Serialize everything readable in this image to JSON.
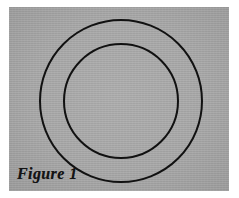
{
  "figure": {
    "caption": "Figure 1",
    "alt_description": "Two concentric circles drawn in black on a gray rectangular plate",
    "plate": {
      "fill_color": "#a8a8a8",
      "x": 9,
      "y": 7,
      "width": 220,
      "height": 184
    },
    "page_background_color": "#ffffff",
    "stroke_color": "#111111",
    "stroke_width": 2
  },
  "chart_data": {
    "type": "diagram",
    "title": "Figure 1",
    "subtitle": "",
    "xlabel": "",
    "ylabel": "",
    "grid": false,
    "legend": "none",
    "shapes": [
      {
        "name": "outer-circle",
        "type": "circle",
        "cx": 121,
        "cy": 101,
        "r": 81,
        "stroke": "#111111",
        "stroke_width": 2,
        "fill": "none"
      },
      {
        "name": "inner-circle",
        "type": "circle",
        "cx": 121,
        "cy": 101,
        "r": 57,
        "stroke": "#111111",
        "stroke_width": 2,
        "fill": "none"
      }
    ],
    "annotations": [
      {
        "name": "figure-caption",
        "text": "Figure 1",
        "x": 17,
        "y": 181
      }
    ],
    "xlim": [
      0,
      239
    ],
    "ylim": [
      0,
      198
    ]
  }
}
